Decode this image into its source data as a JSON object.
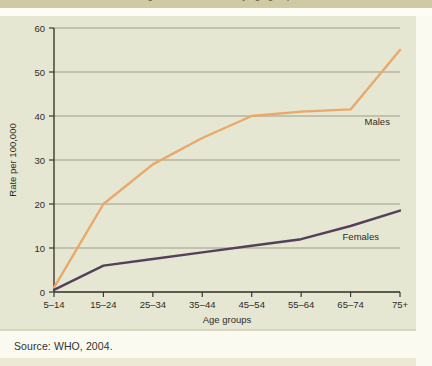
{
  "top_caption": {
    "text": "Figure 1. Suicide rates by age group"
  },
  "footer": {
    "source": "Source: WHO, 2004."
  },
  "chart_data": {
    "type": "line",
    "title": "",
    "xlabel": "Age groups",
    "ylabel": "Rate per 100,000",
    "categories": [
      "5–14",
      "15–24",
      "25–34",
      "35–44",
      "45–54",
      "55–64",
      "65–74",
      "75+"
    ],
    "ylim": [
      0,
      60
    ],
    "yticks": [
      0,
      10,
      20,
      30,
      40,
      50,
      60
    ],
    "ytick_labels": [
      "0",
      "10",
      "20",
      "30",
      "40",
      "50",
      "60"
    ],
    "grid": true,
    "legend_position": "inline-right",
    "series": [
      {
        "name": "Males",
        "color": "#eaa86a",
        "values": [
          1,
          20,
          29,
          35,
          40,
          41,
          41.5,
          55
        ],
        "label_at_index": 6,
        "label_dx": 14,
        "label_dy": 16
      },
      {
        "name": "Females",
        "color": "#55405c",
        "values": [
          0.5,
          6,
          7.5,
          9,
          10.5,
          12,
          15,
          18.5
        ],
        "label_at_index": 6,
        "label_dx": -8,
        "label_dy": 14
      }
    ]
  }
}
